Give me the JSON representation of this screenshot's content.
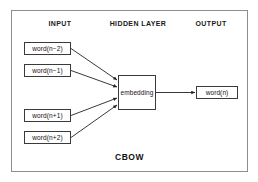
{
  "figure": {
    "caption": "CBOW",
    "border_color": "#8d8d8d",
    "node_border_color": "#3a3a3a",
    "edge_color": "#222222",
    "background": "#ffffff"
  },
  "columns": [
    {
      "id": "input",
      "label": "INPUT"
    },
    {
      "id": "hidden",
      "label": "HIDDEN LAYER"
    },
    {
      "id": "output",
      "label": "OUTPUT"
    }
  ],
  "input_nodes": [
    {
      "label": "word(n−2)"
    },
    {
      "label": "word(n−1)"
    },
    {
      "label": "word(n+1)"
    },
    {
      "label": "word(n+2)"
    }
  ],
  "hidden_node": {
    "label": "embedding"
  },
  "output_node": {
    "label": "word(n)"
  },
  "edges": [
    {
      "from": "word(n−2)",
      "to": "embedding"
    },
    {
      "from": "word(n−1)",
      "to": "embedding"
    },
    {
      "from": "word(n+1)",
      "to": "embedding"
    },
    {
      "from": "word(n+2)",
      "to": "embedding"
    },
    {
      "from": "embedding",
      "to": "word(n)"
    }
  ]
}
